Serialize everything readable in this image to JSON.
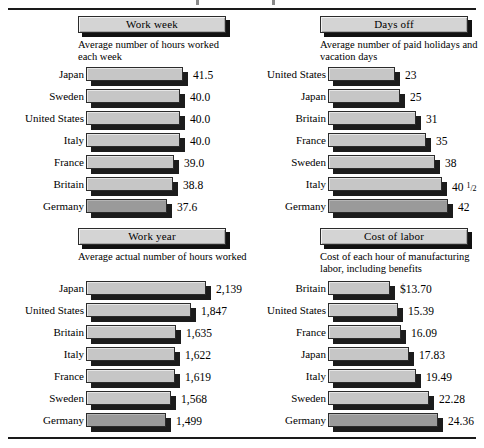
{
  "figure": {
    "bar_color": "#c6c6c6",
    "highlight_color": "#9a9a9a",
    "shadow_color": "#1c1c1c",
    "rule_color": "#1a1a1a"
  },
  "chart_data": [
    {
      "type": "bar",
      "id": "work-week",
      "title": "Work week",
      "subtitle": "Average number of hours worked each week",
      "orientation": "horizontal",
      "categories": [
        "Japan",
        "Sweden",
        "United States",
        "Italy",
        "France",
        "Britain",
        "Germany"
      ],
      "values": [
        41.5,
        40.0,
        40.0,
        40.0,
        39.0,
        38.8,
        37.6
      ],
      "value_labels": [
        "41.5",
        "40.0",
        "40.0",
        "40.0",
        "39.0",
        "38.8",
        "37.6"
      ],
      "bar_lengths_px": [
        97,
        94,
        94,
        94,
        88,
        87,
        81
      ],
      "highlight_index": 6,
      "xlabel": "",
      "ylabel": "",
      "grid": false,
      "legend": "none",
      "note": "Axis is truncated; bars are not drawn from zero."
    },
    {
      "type": "bar",
      "id": "days-off",
      "title": "Days off",
      "subtitle": "Average number of paid holidays and vacation days",
      "orientation": "horizontal",
      "categories": [
        "United States",
        "Japan",
        "Britain",
        "France",
        "Sweden",
        "Italy",
        "Germany"
      ],
      "values": [
        23,
        25,
        31,
        35,
        38,
        40.5,
        42
      ],
      "value_labels": [
        "23",
        "25",
        "31",
        "35",
        "38",
        "40 1/2",
        "42"
      ],
      "bar_lengths_px": [
        67,
        72,
        88,
        98,
        107,
        114,
        120
      ],
      "highlight_index": 6,
      "xlabel": "",
      "ylabel": "",
      "grid": false,
      "legend": "none"
    },
    {
      "type": "bar",
      "id": "work-year",
      "title": "Work year",
      "subtitle": "Average actual number of hours worked",
      "orientation": "horizontal",
      "categories": [
        "Japan",
        "United States",
        "Britain",
        "Italy",
        "France",
        "Sweden",
        "Germany"
      ],
      "values": [
        2139,
        1847,
        1635,
        1622,
        1619,
        1568,
        1499
      ],
      "value_labels": [
        "2,139",
        "1,847",
        "1,635",
        "1,622",
        "1,619",
        "1,568",
        "1,499"
      ],
      "bar_lengths_px": [
        120,
        105,
        90,
        89,
        89,
        85,
        80
      ],
      "highlight_index": 6,
      "xlabel": "",
      "ylabel": "",
      "grid": false,
      "legend": "none",
      "note": "Axis is truncated; bars are not drawn from zero."
    },
    {
      "type": "bar",
      "id": "cost-of-labor",
      "title": "Cost of labor",
      "subtitle": "Cost of each hour of manufacturing labor, including benefits",
      "orientation": "horizontal",
      "categories": [
        "Britain",
        "United States",
        "France",
        "Japan",
        "Italy",
        "Sweden",
        "Germany"
      ],
      "values": [
        13.7,
        15.39,
        16.09,
        17.83,
        19.49,
        22.28,
        24.36
      ],
      "value_labels": [
        "$13.70",
        "15.39",
        "16.09",
        "17.83",
        "19.49",
        "22.28",
        "24.36"
      ],
      "bar_lengths_px": [
        62,
        70,
        73,
        81,
        88,
        101,
        110
      ],
      "highlight_index": 6,
      "xlabel": "",
      "ylabel": "",
      "grid": false,
      "legend": "none",
      "units": "US dollars per hour"
    }
  ]
}
